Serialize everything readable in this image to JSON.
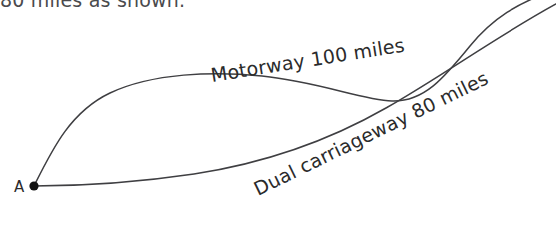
{
  "figure": {
    "type": "route-diagram",
    "background_color": "#ffffff",
    "line_color": "#3f3f42",
    "text_color": "#2b2b2b",
    "cropped_heading_text": "80 miles as shown.",
    "cropped_footer_text": "",
    "start_node": {
      "label": "A",
      "x": 34,
      "y": 186
    },
    "routes": [
      {
        "id": "motorway",
        "label": "Motorway 100 miles",
        "name": "Motorway",
        "distance_value": "100",
        "distance_unit": "miles",
        "label_x": 212,
        "label_y": 82,
        "label_rotation": -9,
        "path": "M 34 186 C 52 150 70 112 110 93 C 152 73 214 71 262 76 C 320 82 362 100 392 101 C 424 102 444 78 470 46 C 492 19 518 2 556 -10"
      },
      {
        "id": "dual-carriageway",
        "label": "Dual carriageway 80 miles",
        "name": "Dual carriageway",
        "distance_value": "80",
        "distance_unit": "miles",
        "label_x": 258,
        "label_y": 196,
        "label_rotation": -26,
        "path": "M 34 186 C 90 186 140 182 194 174 C 266 163 330 140 386 108 C 444 75 494 38 556 4"
      }
    ]
  }
}
